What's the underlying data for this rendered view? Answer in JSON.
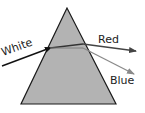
{
  "diagram": {
    "prism": {
      "fill": "#b3b3b3",
      "stroke": "#1a1a1a",
      "apex": [
        67,
        8
      ],
      "base_left": [
        21,
        104
      ],
      "base_right": [
        116,
        104
      ]
    },
    "rays": [
      {
        "name": "White",
        "color": "#111111",
        "from": [
          2,
          66
        ],
        "to": [
          50,
          48
        ]
      },
      {
        "name": "internal",
        "color": "#333333",
        "from": [
          50,
          48
        ],
        "to": [
          83,
          44
        ]
      },
      {
        "name": "Red",
        "color": "#444444",
        "from": [
          83,
          44
        ],
        "to": [
          136,
          51
        ]
      },
      {
        "name": "Blue",
        "color": "#8a8a8a",
        "from": [
          83,
          48
        ],
        "to": [
          134,
          74
        ]
      }
    ],
    "labels": {
      "white": "White",
      "red": "Red",
      "blue": "Blue"
    }
  }
}
